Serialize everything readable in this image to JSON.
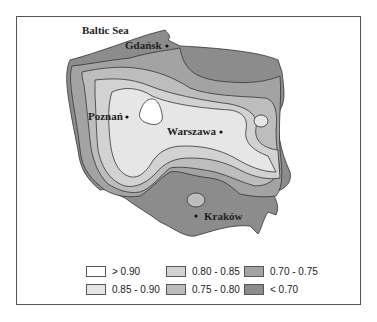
{
  "map": {
    "region": "Poland",
    "labels": {
      "sea": "Baltic Sea",
      "cities": [
        "Gdańsk",
        "Poznań",
        "Warszawa",
        "Kraków"
      ]
    }
  },
  "legend": {
    "items": [
      {
        "label": "> 0.90",
        "color": "#ffffff"
      },
      {
        "label": "0.85 - 0.90",
        "color": "#e6e6e6"
      },
      {
        "label": "0.80 - 0.85",
        "color": "#d2d2d2"
      },
      {
        "label": "0.75 - 0.80",
        "color": "#bdbdbd"
      },
      {
        "label": "0.70 - 0.75",
        "color": "#a3a3a3"
      },
      {
        "label": "< 0.70",
        "color": "#8c8c8c"
      }
    ]
  }
}
